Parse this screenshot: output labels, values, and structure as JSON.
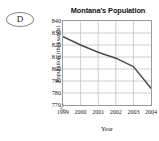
{
  "badge": {
    "letter": "D",
    "shape": "oval-outline"
  },
  "chart_data": {
    "type": "line",
    "title": "Montana's Population",
    "xlabel": "Year",
    "ylabel": "Population (thousands)",
    "categories": [
      "1999",
      "2000",
      "2001",
      "2002",
      "2003",
      "2004"
    ],
    "x": [
      1999,
      2000,
      2001,
      2002,
      2003,
      2004
    ],
    "values": [
      827,
      820,
      814,
      809,
      802,
      784
    ],
    "series": [
      {
        "name": "Montana population",
        "values": [
          827,
          820,
          814,
          809,
          802,
          784
        ]
      }
    ],
    "ylim": [
      770,
      840
    ],
    "yticks": [
      840,
      830,
      820,
      810,
      800,
      790,
      780,
      770
    ],
    "ytick_labels": [
      "840",
      "830",
      "820",
      "810",
      "800",
      "790",
      "780",
      "770"
    ],
    "xtick_labels": [
      "1999",
      "2000",
      "2001",
      "2002",
      "2003",
      "2004"
    ],
    "grid": true,
    "legend": false,
    "axis_break_y": true,
    "line_color": "#4a4a4a",
    "grid_color": "#b9b9b9",
    "axis_color": "#9a9a9a"
  }
}
